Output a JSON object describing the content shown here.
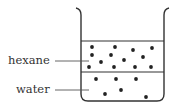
{
  "diagram": {
    "type": "beaker-two-layers",
    "colors": {
      "stroke": "#333333",
      "dot": "#222222",
      "background": "#ffffff"
    },
    "labels": [
      {
        "id": "hexane",
        "text": "hexane"
      },
      {
        "id": "water",
        "text": "water"
      }
    ],
    "layers": [
      {
        "name": "hexane",
        "position": "top",
        "particles": [
          [
            92,
            47
          ],
          [
            115,
            47
          ],
          [
            133,
            50
          ],
          [
            152,
            48
          ],
          [
            92,
            55
          ],
          [
            111,
            55
          ],
          [
            143,
            57
          ],
          [
            101,
            62
          ],
          [
            124,
            60
          ],
          [
            89,
            67
          ],
          [
            114,
            67
          ],
          [
            135,
            67
          ],
          [
            151,
            67
          ]
        ]
      },
      {
        "name": "water",
        "position": "bottom",
        "particles": [
          [
            96,
            79
          ],
          [
            116,
            79
          ],
          [
            136,
            79
          ],
          [
            105,
            94
          ],
          [
            121,
            90
          ],
          [
            146,
            97
          ]
        ]
      }
    ]
  }
}
